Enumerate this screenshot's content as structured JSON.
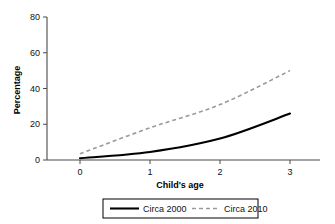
{
  "chart_data": {
    "type": "line",
    "title": "",
    "xlabel": "Child's age",
    "ylabel": "Percentage",
    "x": [
      0,
      1,
      2,
      3
    ],
    "xtick_labels": [
      "0",
      "1",
      "2",
      "3"
    ],
    "ytick_labels": [
      "0",
      "20",
      "40",
      "60",
      "80"
    ],
    "yticks": [
      0,
      20,
      40,
      60,
      80
    ],
    "xlim": [
      0,
      3
    ],
    "ylim": [
      0,
      80
    ],
    "grid": false,
    "legend_position": "bottom-center",
    "series": [
      {
        "name": "Circa 2000",
        "values": [
          1,
          4.5,
          12,
          26
        ],
        "style": "solid",
        "color": "#000000"
      },
      {
        "name": "Circa 2010",
        "values": [
          3.5,
          18,
          31,
          50
        ],
        "style": "dashed",
        "color": "#9a9a9a"
      }
    ]
  },
  "legend": {
    "items": [
      {
        "label": "Circa 2000"
      },
      {
        "label": "Circa 2010"
      }
    ]
  },
  "colors": {
    "series_2000": "#000000",
    "series_2010": "#9a9a9a",
    "axis": "#4a4a4a",
    "background": "#ffffff"
  }
}
